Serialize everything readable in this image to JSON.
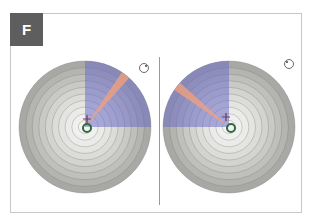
{
  "panel": {
    "label": "F"
  },
  "colors": {
    "ring_outer": "#a8a8a4",
    "ring_inner": "#f4f4f2",
    "ring_line": "#6e6e6e",
    "quadrant": "#6f70c8",
    "ray": "#f0a080",
    "marker_ring": "#2e6b3e",
    "cross": "#6a3a5a"
  },
  "plots": [
    {
      "name": "left-eye-plot",
      "center_x": 85,
      "center_y": 127,
      "radius": 66,
      "rings": 10,
      "quadrant": "upper-right",
      "ray_angle_deg": 52,
      "marker": {
        "dx": 2,
        "dy": 1
      },
      "cross": {
        "dx": 2,
        "dy": -8
      },
      "rotation_icon": {
        "x": 144,
        "y": 68,
        "dot": "right"
      }
    },
    {
      "name": "right-eye-plot",
      "center_x": 229,
      "center_y": 127,
      "radius": 66,
      "rings": 10,
      "quadrant": "upper-left",
      "ray_angle_deg": 142,
      "marker": {
        "dx": 2,
        "dy": 1
      },
      "cross": {
        "dx": -3,
        "dy": -10
      },
      "rotation_icon": {
        "x": 289,
        "y": 64,
        "dot": "left"
      }
    }
  ]
}
